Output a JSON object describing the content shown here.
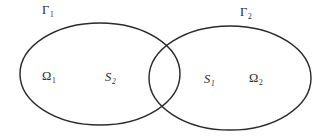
{
  "figure": {
    "background_color": "#ffffff",
    "stroke_color": "#2b2b2b",
    "width": 325,
    "height": 140
  },
  "labels": {
    "boundary_left": {
      "symbol": "Γ",
      "subscript": "1"
    },
    "boundary_right": {
      "symbol": "Γ",
      "subscript": "2"
    },
    "domain_left": {
      "symbol": "Ω",
      "subscript": "1"
    },
    "domain_right": {
      "symbol": "Ω",
      "subscript": "2"
    },
    "interface_left": {
      "symbol": "S",
      "subscript": "2"
    },
    "interface_right": {
      "symbol": "S",
      "subscript": "1"
    }
  },
  "shapes": {
    "ellipse_left": {
      "cx": 100,
      "cy": 74,
      "rx": 80,
      "ry": 51
    },
    "ellipse_right": {
      "cx": 230,
      "cy": 78,
      "rx": 81,
      "ry": 52
    }
  }
}
